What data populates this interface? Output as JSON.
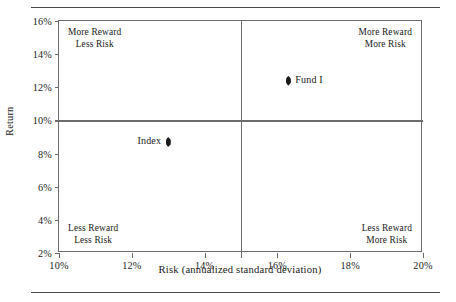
{
  "chart_data": {
    "type": "scatter",
    "title": "",
    "xlabel": "Risk (annualized standard deviation)",
    "ylabel": "Return",
    "xlim": [
      10,
      20
    ],
    "ylim": [
      2,
      16
    ],
    "xticks": [
      "10%",
      "12%",
      "14%",
      "16%",
      "18%",
      "20%"
    ],
    "xtick_values": [
      10,
      12,
      14,
      16,
      18,
      20
    ],
    "yticks": [
      "2%",
      "4%",
      "6%",
      "8%",
      "10%",
      "12%",
      "14%",
      "16%"
    ],
    "ytick_values": [
      2,
      4,
      6,
      8,
      10,
      12,
      14,
      16
    ],
    "grid": false,
    "legend": "none",
    "reference_lines": {
      "vertical_x": 15,
      "horizontal_y": 10
    },
    "points": [
      {
        "label": "Fund I",
        "x": 16.3,
        "y": 12.4,
        "label_side": "right"
      },
      {
        "label": "Index",
        "x": 13.0,
        "y": 8.7,
        "label_side": "left"
      }
    ],
    "annotations": [
      {
        "id": "top-left",
        "line1": "More Reward",
        "line2": "Less Risk"
      },
      {
        "id": "top-right",
        "line1": "More Reward",
        "line2": "More Risk"
      },
      {
        "id": "bottom-left",
        "line1": "Less Reward",
        "line2": "Less Risk"
      },
      {
        "id": "bottom-right",
        "line1": "Less Reward",
        "line2": "More Risk"
      }
    ]
  },
  "colors": {
    "frame": "#6b6b6b",
    "rule": "#4a4a4a",
    "marker": "#1a1a1a",
    "text": "#1a1a1a",
    "background": "#ffffff"
  }
}
